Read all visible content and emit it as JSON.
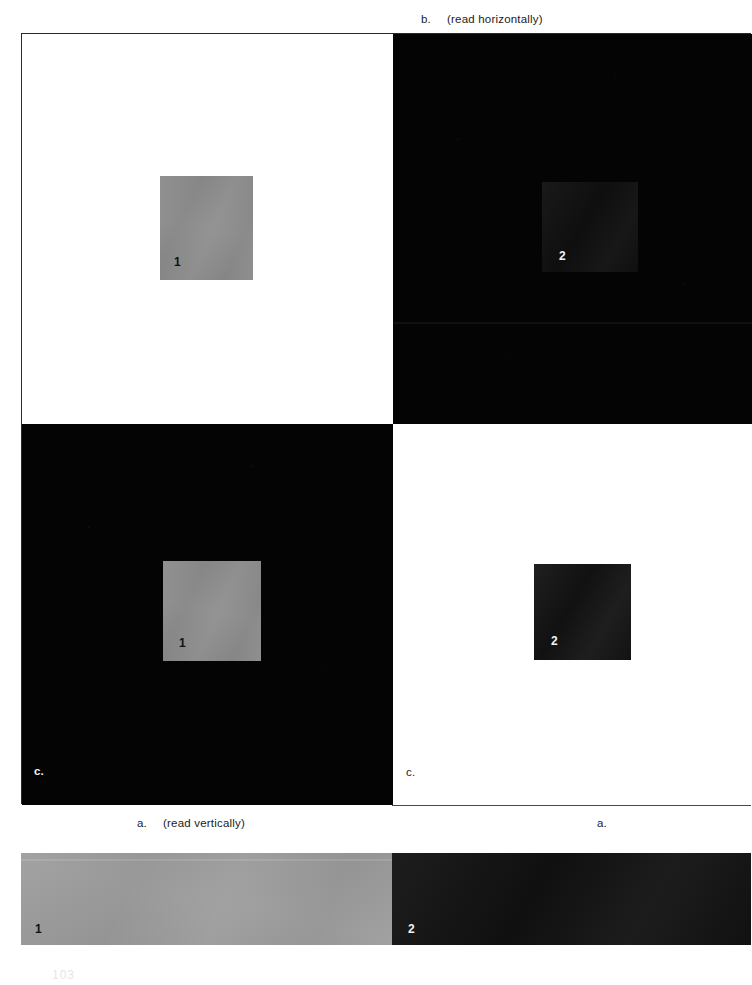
{
  "figure": {
    "kind": "simultaneous-lightness-contrast-plate",
    "captions": {
      "top": {
        "tag": "b.",
        "text": "(read horizontally)"
      },
      "bottom_left_quadrant_corner": {
        "tag": "c.",
        "text": ""
      },
      "bottom_right_quadrant_corner": {
        "tag": "c.",
        "text": ""
      },
      "below_left": {
        "tag": "a.",
        "text": "(read vertically)"
      },
      "below_right": {
        "tag": "a.",
        "text": ""
      }
    },
    "quadrants": [
      {
        "position": "top-left",
        "background": "white",
        "background_color": "#ffffff",
        "patch_label": "1",
        "patch_color": "#8c8c8c",
        "patch_label_color": "#111111"
      },
      {
        "position": "top-right",
        "background": "black",
        "background_color": "#040404",
        "patch_label": "2",
        "patch_color": "#121212",
        "patch_label_color": "#f2f2f2"
      },
      {
        "position": "bottom-left",
        "background": "black",
        "background_color": "#040404",
        "patch_label": "1",
        "patch_color": "#8c8c8c",
        "patch_label_color": "#111111",
        "corner_tag": "c."
      },
      {
        "position": "bottom-right",
        "background": "white",
        "background_color": "#ffffff",
        "patch_label": "2",
        "patch_color": "#171717",
        "patch_label_color": "#f2f2f2",
        "corner_tag": "c."
      }
    ],
    "comparison_strip": {
      "segments": [
        {
          "label": "1",
          "color": "#9b9b9b",
          "label_color": "#111111"
        },
        {
          "label": "2",
          "color": "#151515",
          "label_color": "#f2f2f2"
        }
      ]
    }
  },
  "page": {
    "number": "103"
  }
}
